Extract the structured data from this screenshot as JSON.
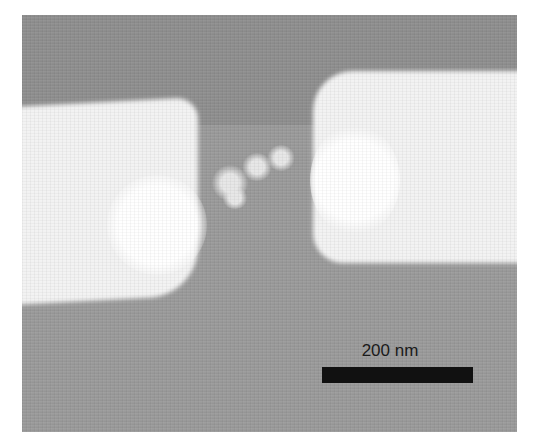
{
  "image": {
    "type": "SEM micrograph",
    "description": "Two bright metal electrodes separated by a nanogap containing small particles on a gray substrate",
    "colors": {
      "substrate": "#9a9a9a",
      "electrode": "#f2f2f2",
      "scale_bar": "#111111",
      "border": "#ffffff"
    }
  },
  "scale_bar": {
    "label": "200 nm"
  }
}
